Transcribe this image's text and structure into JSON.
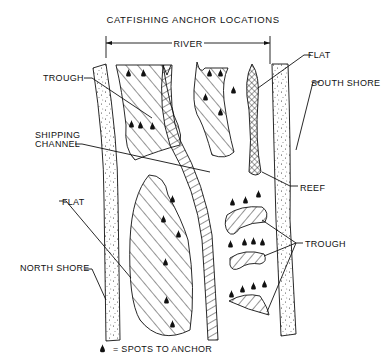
{
  "title": "CATFISHING ANCHOR LOCATIONS",
  "dimension_label": "RIVER",
  "labels": {
    "trough_upper": "TROUGH",
    "shipping_channel_line1": "SHIPPING",
    "shipping_channel_line2": "CHANNEL",
    "flat_left": "FLAT",
    "north_shore": "NORTH SHORE",
    "flat_right": "FLAT",
    "south_shore": "SOUTH SHORE",
    "reef": "REEF",
    "trough_right": "TROUGH"
  },
  "legend": {
    "icon": "anchor-spot-marker",
    "text": "= SPOTS TO ANCHOR"
  },
  "features": [
    {
      "name": "North Shore",
      "pattern": "stipple"
    },
    {
      "name": "South Shore",
      "pattern": "stipple"
    },
    {
      "name": "Shipping Channel",
      "pattern": "ladder-hatch"
    },
    {
      "name": "Upper Trough",
      "pattern": "diagonal-hatch",
      "anchor_spots": 5
    },
    {
      "name": "Upper Flat",
      "pattern": "diagonal-hatch",
      "anchor_spots": 5
    },
    {
      "name": "Lower Flat",
      "pattern": "diagonal-hatch",
      "anchor_spots": 6
    },
    {
      "name": "Reef",
      "pattern": "crosshatch"
    },
    {
      "name": "Troughs (3)",
      "pattern": "diagonal-hatch",
      "anchor_spots": 11
    }
  ]
}
